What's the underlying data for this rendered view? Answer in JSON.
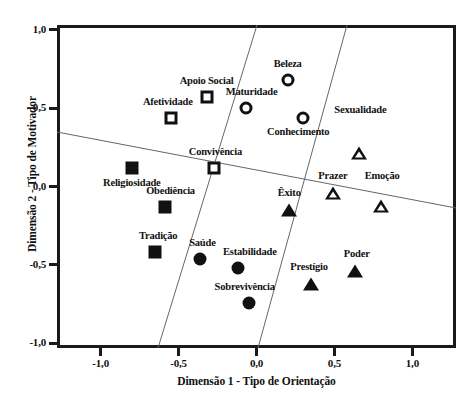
{
  "chart_data": {
    "type": "scatter",
    "title": "",
    "xlabel": "Dimensão 1 - Tipo de Orientação",
    "ylabel": "Dimensão 2 - Tipo de Motivador",
    "xlim": [
      -1.28,
      1.28
    ],
    "ylim": [
      -1.03,
      1.03
    ],
    "xticks": [
      "-1,0",
      "-0,5",
      "0,0",
      "0,5",
      "1,0"
    ],
    "xtick_values": [
      -1.0,
      -0.5,
      0.0,
      0.5,
      1.0
    ],
    "yticks": [
      "1,0",
      "0,5",
      "0,0",
      "-0,5",
      "-1,0"
    ],
    "ytick_values": [
      1.0,
      0.5,
      0.0,
      -0.5,
      -1.0
    ],
    "grid": false,
    "legend": "none",
    "series": [
      {
        "name": "open-square",
        "marker": "square-open",
        "points": [
          {
            "label": "Apoio Social",
            "x": -0.32,
            "y": 0.57,
            "label_dx": 0,
            "label_dy": -11
          },
          {
            "label": "Afetividade",
            "x": -0.55,
            "y": 0.44,
            "label_dx": -3,
            "label_dy": -11
          },
          {
            "label": "Convivência",
            "x": -0.27,
            "y": 0.12,
            "label_dx": 1,
            "label_dy": -11
          }
        ]
      },
      {
        "name": "filled-square",
        "marker": "square-filled",
        "points": [
          {
            "label": "Religiosidade",
            "x": -0.8,
            "y": 0.12,
            "label_dx": 0,
            "label_dy": 20
          },
          {
            "label": "Obediência",
            "x": -0.59,
            "y": -0.13,
            "label_dx": 6,
            "label_dy": -11
          },
          {
            "label": "Tradição",
            "x": -0.65,
            "y": -0.42,
            "label_dx": 3,
            "label_dy": -11
          }
        ]
      },
      {
        "name": "open-circle",
        "marker": "circle-open",
        "points": [
          {
            "label": "Beleza",
            "x": 0.2,
            "y": 0.68,
            "label_dx": 0,
            "label_dy": -11
          },
          {
            "label": "Maturidade",
            "x": -0.07,
            "y": 0.5,
            "label_dx": 6,
            "label_dy": -11
          },
          {
            "label": "Conhecimento",
            "x": 0.3,
            "y": 0.44,
            "label_dx": -5,
            "label_dy": 19
          }
        ]
      },
      {
        "name": "filled-circle",
        "marker": "circle-filled",
        "points": [
          {
            "label": "Saúde",
            "x": -0.36,
            "y": -0.46,
            "label_dx": 2,
            "label_dy": -11
          },
          {
            "label": "Estabilidade",
            "x": -0.12,
            "y": -0.52,
            "label_dx": 12,
            "label_dy": -11
          },
          {
            "label": "Sobrevivência",
            "x": -0.05,
            "y": -0.74,
            "label_dx": -4,
            "label_dy": -11
          }
        ]
      },
      {
        "name": "open-triangle",
        "marker": "triangle-open",
        "points": [
          {
            "label": "Prazer",
            "x": 0.49,
            "y": -0.04,
            "label_dx": 0,
            "label_dy": -12
          },
          {
            "label": "Emoção",
            "x": 0.8,
            "y": -0.04,
            "label_dx": 1,
            "label_dy": -12
          },
          {
            "label": "Sexualidade",
            "x": 0.66,
            "y": 0.38,
            "label_dx": 1,
            "label_dy": -12
          }
        ]
      },
      {
        "name": "filled-triangle",
        "marker": "triangle-filled",
        "points": [
          {
            "label": "Êxito",
            "x": 0.21,
            "y": -0.15,
            "label_dx": 0,
            "label_dy": -12
          },
          {
            "label": "Prestígio",
            "x": 0.35,
            "y": -0.62,
            "label_dx": -2,
            "label_dy": -12
          },
          {
            "label": "Poder",
            "x": 0.63,
            "y": -0.54,
            "label_dx": 2,
            "label_dy": -12
          }
        ]
      }
    ],
    "partition_lines": [
      {
        "name": "horizontal-divider",
        "x1": 57,
        "y1": 132,
        "x2": 456,
        "y2": 208
      },
      {
        "name": "left-radial-divider",
        "x1": 257,
        "y1": 25,
        "x2": 158,
        "y2": 348
      },
      {
        "name": "right-radial-divider",
        "x1": 347,
        "y1": 25,
        "x2": 258,
        "y2": 348
      }
    ],
    "colors": {
      "marker": "#111111",
      "axis": "#1a1a1a",
      "partition": "#666666",
      "background": "#ffffff"
    }
  }
}
